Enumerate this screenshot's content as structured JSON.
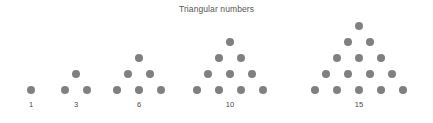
{
  "chart_data": {
    "type": "scatter",
    "title": "Triangular numbers",
    "xlabel": "",
    "ylabel": "",
    "grid": false,
    "legend": null,
    "categories": [
      "1",
      "3",
      "6",
      "10",
      "15"
    ],
    "values": [
      1,
      3,
      6,
      10,
      15
    ],
    "series": [
      {
        "name": "Triangular numbers",
        "values": [
          1,
          3,
          6,
          10,
          15
        ],
        "rows_per_group": [
          1,
          2,
          3,
          4,
          5
        ]
      }
    ],
    "groups": [
      {
        "label": "1",
        "count": 1,
        "rows": 1,
        "center_x": 31,
        "baseline_y": 90,
        "label_x": 31,
        "label_y": 100
      },
      {
        "label": "3",
        "count": 3,
        "rows": 2,
        "center_x": 76,
        "baseline_y": 90,
        "label_x": 76,
        "label_y": 100
      },
      {
        "label": "6",
        "count": 6,
        "rows": 3,
        "center_x": 139,
        "baseline_y": 90,
        "label_x": 139,
        "label_y": 100
      },
      {
        "label": "10",
        "count": 10,
        "rows": 4,
        "center_x": 230,
        "baseline_y": 90,
        "label_x": 230,
        "label_y": 100
      },
      {
        "label": "15",
        "count": 15,
        "rows": 5,
        "center_x": 359,
        "baseline_y": 90,
        "label_x": 359,
        "label_y": 100
      }
    ],
    "marker": {
      "shape": "circle",
      "diameter": 8,
      "color": "#808080"
    },
    "spacing": {
      "dot_gap_x": 22,
      "dot_gap_y": 16
    },
    "colors": {
      "background": "#ffffff",
      "dot": "#808080",
      "title": "#555555",
      "label": "#4a4a4a"
    }
  }
}
